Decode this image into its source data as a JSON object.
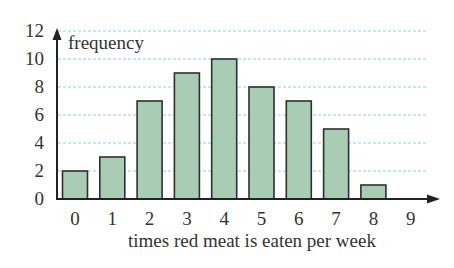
{
  "chart_data": {
    "type": "bar",
    "title": "",
    "xlabel": "times red meat is eaten per week",
    "ylabel": "frequency",
    "categories": [
      "0",
      "1",
      "2",
      "3",
      "4",
      "5",
      "6",
      "7",
      "8",
      "9"
    ],
    "values": [
      2,
      3,
      7,
      9,
      10,
      8,
      7,
      5,
      1,
      0
    ],
    "yticks": [
      "0",
      "2",
      "4",
      "6",
      "8",
      "10",
      "12"
    ],
    "ylim": [
      0,
      12
    ],
    "grid": true,
    "bar_color": "#a8cdb4",
    "bar_edge_color": "#2f2f2f",
    "grid_color": "#8fd0e6"
  }
}
